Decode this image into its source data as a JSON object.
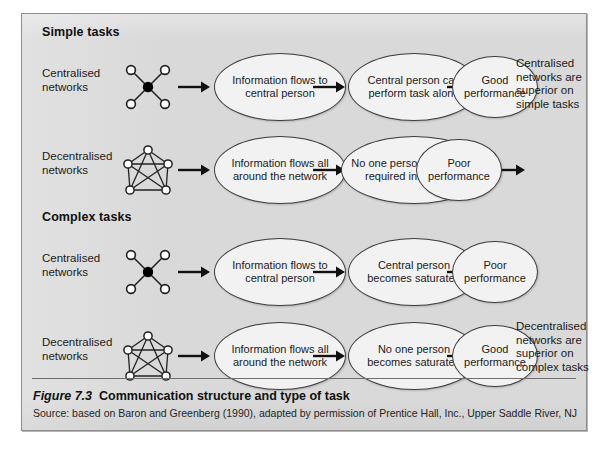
{
  "figure": {
    "caption_number": "Figure 7.3",
    "caption_title": "Communication structure and type of task",
    "source": "Source: based on Baron and Greenberg (1990), adapted by permission of Prentice Hall, Inc., Upper Saddle River, NJ"
  },
  "sections": {
    "simple": {
      "heading": "Simple tasks"
    },
    "complex": {
      "heading": "Complex tasks"
    }
  },
  "rows": {
    "simple_centralised": {
      "label": "Centralised\nnetworks",
      "network_icon": "centralised-network-icon",
      "steps": [
        "Information flows to central person",
        "Central person can perform task alone",
        "Good performance"
      ]
    },
    "simple_decentralised": {
      "label": "Decentralised\nnetworks",
      "network_icon": "decentralised-network-icon",
      "steps": [
        "Information flows all around the network",
        "No one person has all the required information",
        "Poor performance"
      ]
    },
    "complex_centralised": {
      "label": "Centralised\nnetworks",
      "network_icon": "centralised-network-icon",
      "steps": [
        "Information flows to central person",
        "Central person becomes saturated",
        "Poor performance"
      ]
    },
    "complex_decentralised": {
      "label": "Decentralised\nnetworks",
      "network_icon": "decentralised-network-icon",
      "steps": [
        "Information flows all around the network",
        "No one person becomes saturated",
        "Good performance"
      ]
    }
  },
  "conclusions": {
    "simple": "Centralised networks are superior on simple tasks",
    "complex": "Decentralised networks are superior on complex tasks"
  },
  "colors": {
    "panel_background": "#d9d9d9",
    "panel_border": "#8e8e8e",
    "ellipse_fill": "#f2f2f2",
    "ellipse_stroke": "#3d3d3d",
    "node_fill": "#ffffff",
    "hub_fill": "#000000",
    "text": "#1b1b1b"
  }
}
